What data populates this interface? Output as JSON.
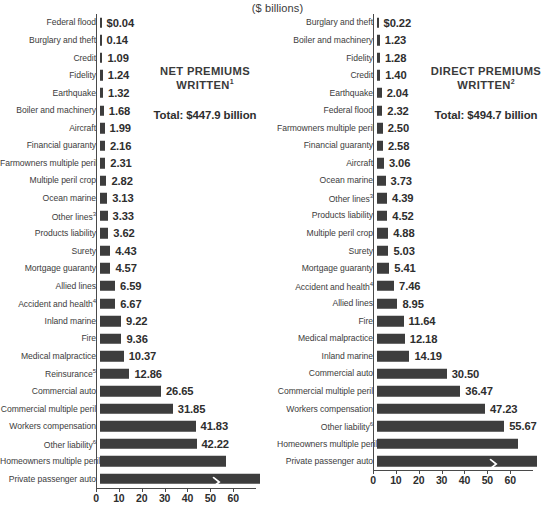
{
  "units_label": "($ billions)",
  "axis": {
    "ticks": [
      0,
      10,
      20,
      30,
      40,
      50,
      60
    ],
    "min": 0,
    "max": 70,
    "broken": true
  },
  "left_panel": {
    "title_line1": "NET PREMIUMS",
    "title_line2": "WRITTEN",
    "title_footnote": "1",
    "total_label": "Total: $447.9 billion"
  },
  "right_panel": {
    "title_line1": "DIRECT PREMIUMS",
    "title_line2": "WRITTEN",
    "title_footnote": "2",
    "total_label": "Total: $494.7 billion"
  },
  "chart_data": [
    {
      "type": "bar",
      "orientation": "horizontal",
      "title": "NET PREMIUMS WRITTEN",
      "title_footnote": "1",
      "subtitle": "Total: $447.9 billion",
      "xlabel": "($ billions)",
      "ylabel": "",
      "xlim": [
        0,
        70
      ],
      "xticks": [
        0,
        10,
        20,
        30,
        40,
        50,
        60
      ],
      "grid": false,
      "legend": "none",
      "broken_axis": true,
      "categories": [
        "Federal flood",
        "Burglary and theft",
        "Credit",
        "Fidelity",
        "Earthquake",
        "Boiler and machinery",
        "Aircraft",
        "Financial guaranty",
        "Farmowners multiple peril",
        "Multiple peril crop",
        "Ocean marine",
        "Other lines",
        "Products liability",
        "Surety",
        "Mortgage guaranty",
        "Allied lines",
        "Accident and health",
        "Inland marine",
        "Fire",
        "Medical malpractice",
        "Reinsurance",
        "Commercial auto",
        "Commercial multiple peril",
        "Workers compensation",
        "Other liability",
        "Homeowners multiple peril",
        "Private passenger auto"
      ],
      "category_footnotes": [
        "",
        "",
        "",
        "",
        "",
        "",
        "",
        "",
        "",
        "",
        "",
        "3",
        "",
        "",
        "",
        "",
        "4",
        "",
        "",
        "",
        "5",
        "",
        "",
        "",
        "6",
        "",
        ""
      ],
      "values": [
        0.04,
        0.14,
        1.09,
        1.24,
        1.32,
        1.68,
        1.99,
        2.16,
        2.31,
        2.82,
        3.13,
        3.33,
        3.62,
        4.43,
        4.57,
        6.59,
        6.67,
        9.22,
        9.36,
        10.37,
        12.86,
        26.65,
        31.85,
        41.83,
        42.22,
        55.0,
        70.0
      ],
      "value_labels": [
        "$0.04",
        "0.14",
        "1.09",
        "1.24",
        "1.32",
        "1.68",
        "1.99",
        "2.16",
        "2.31",
        "2.82",
        "3.13",
        "3.33",
        "3.62",
        "4.43",
        "4.57",
        "6.59",
        "6.67",
        "9.22",
        "9.36",
        "10.37",
        "12.86",
        "26.65",
        "31.85",
        "41.83",
        "42.22",
        "",
        ""
      ]
    },
    {
      "type": "bar",
      "orientation": "horizontal",
      "title": "DIRECT PREMIUMS WRITTEN",
      "title_footnote": "2",
      "subtitle": "Total: $494.7 billion",
      "xlabel": "($ billions)",
      "ylabel": "",
      "xlim": [
        0,
        70
      ],
      "xticks": [
        0,
        10,
        20,
        30,
        40,
        50,
        60
      ],
      "grid": false,
      "legend": "none",
      "broken_axis": true,
      "categories": [
        "Burglary and theft",
        "Boiler and machinery",
        "Fidelity",
        "Credit",
        "Earthquake",
        "Federal flood",
        "Farmowners multiple peril",
        "Financial guaranty",
        "Aircraft",
        "Ocean marine",
        "Other lines",
        "Products liability",
        "Multiple peril crop",
        "Surety",
        "Mortgage guaranty",
        "Accident and health",
        "Allied lines",
        "Fire",
        "Medical malpractice",
        "Inland marine",
        "Commercial auto",
        "Commercial multiple peril",
        "Workers compensation",
        "Other liability",
        "Homeowners multiple peril",
        "Private passenger auto"
      ],
      "category_footnotes": [
        "",
        "",
        "",
        "",
        "",
        "",
        "",
        "",
        "",
        "",
        "3",
        "",
        "",
        "",
        "",
        "4",
        "",
        "",
        "",
        "",
        "",
        "",
        "",
        "6",
        "",
        ""
      ],
      "values": [
        0.22,
        1.23,
        1.28,
        1.4,
        2.04,
        2.32,
        2.5,
        2.58,
        3.06,
        3.73,
        4.39,
        4.52,
        4.88,
        5.03,
        5.41,
        7.46,
        8.95,
        11.64,
        12.18,
        14.19,
        30.5,
        36.47,
        47.23,
        55.67,
        61.5,
        70.0
      ],
      "value_labels": [
        "$0.22",
        "1.23",
        "1.28",
        "1.40",
        "2.04",
        "2.32",
        "2.50",
        "2.58",
        "3.06",
        "3.73",
        "4.39",
        "4.52",
        "4.88",
        "5.03",
        "5.41",
        "7.46",
        "8.95",
        "11.64",
        "12.18",
        "14.19",
        "30.50",
        "36.47",
        "47.23",
        "55.67",
        "",
        ""
      ]
    }
  ]
}
